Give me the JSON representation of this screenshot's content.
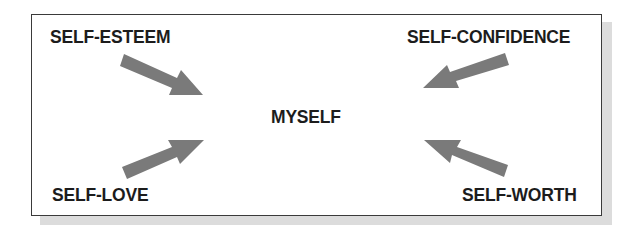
{
  "diagram": {
    "center": {
      "label": "MYSELF"
    },
    "inputs": [
      {
        "label": "SELF-ESTEEM",
        "position": "top-left"
      },
      {
        "label": "SELF-CONFIDENCE",
        "position": "top-right"
      },
      {
        "label": "SELF-LOVE",
        "position": "bottom-left"
      },
      {
        "label": "SELF-WORTH",
        "position": "bottom-right"
      }
    ],
    "arrow_color": "#7a7a7a",
    "border_color": "#3a3a3a",
    "shadow_color": "#dcdcdc"
  }
}
